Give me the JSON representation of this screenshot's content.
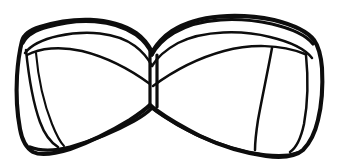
{
  "document": {
    "title": "Bandeau Bra Line Drawing",
    "type": "line-art-illustration",
    "subject": "strapless bandeau bra",
    "description": "Black ink contour drawing of a strapless bandeau bra viewed from the front, flat lay",
    "background_color": "#ffffff",
    "ink_color": "#0d0d0d",
    "width_px": 338,
    "height_px": 168
  },
  "artwork": {
    "style": "hand-drawn black outline, no shading, no fill",
    "line_weights": {
      "outer_contour": "heavy",
      "top_band_inner": "medium",
      "cup_seams": "light",
      "detail_seams": "fine"
    },
    "parts": [
      {
        "name": "left-cup",
        "label": "Left cup"
      },
      {
        "name": "right-cup",
        "label": "Right cup"
      },
      {
        "name": "center-gore",
        "label": "Center gore / bridge"
      },
      {
        "name": "top-band",
        "label": "Top binding band"
      },
      {
        "name": "bottom-band",
        "label": "Bottom underband"
      },
      {
        "name": "left-side-panel",
        "label": "Left side panel"
      },
      {
        "name": "right-side-panel",
        "label": "Right side panel"
      },
      {
        "name": "right-cup-seam",
        "label": "Right cup vertical seam"
      },
      {
        "name": "left-cup-seam",
        "label": "Left cup vertical seam"
      }
    ]
  },
  "geometry": {
    "outer_contour": "M 22 41 C 24 34 30 30 40 27 C 72 17 110 16 136 33 C 143 38 148 44 152 52 C 157 44 163 37 172 31 C 198 14 240 13 274 20 C 294 25 307 31 314 40 C 319 47 321 56 322 68 C 323 86 322 104 318 120 C 315 133 310 143 303 150 C 295 157 282 158 266 156 C 244 153 221 146 200 136 C 182 127 167 118 156 110 C 152 107 151 106 150 105 C 146 109 139 114 130 120 C 112 131 90 142 70 149 C 54 154 41 156 33 152 C 26 148 22 140 20 129 C 17 113 16 94 17 76 C 18 60 20 49 22 41 Z",
    "top_band_line_a": "M 23 43 C 27 35 36 30 48 27 C 78 18 113 19 136 35 C 144 41 149 47 152 55",
    "top_band_line_b": "M 25 53 C 32 44 44 39 58 36 C 86 30 116 32 135 46 C 143 52 148 58 152 66",
    "top_band_line_right_a": "M 152 55 C 157 46 164 39 174 33 C 200 17 240 17 272 24 C 293 29 306 35 313 44",
    "top_band_line_right_b": "M 152 66 C 158 56 167 49 178 43 C 204 30 242 30 270 37 C 291 42 305 49 312 58",
    "bottom_band_line": "M 30 147 C 40 151 54 151 70 147 C 92 141 116 131 134 121 C 143 116 149 111 152 108",
    "bottom_band_line_right": "M 152 108 C 157 112 166 118 178 125 C 199 137 224 147 248 152 C 268 156 286 157 297 153",
    "center_gore_left": "M 150 52 L 150 106",
    "center_gore_right": "M 157 55 L 157 107",
    "left_cup_upper_seam": "M 27 55 C 40 48 60 46 82 51 C 106 57 131 70 150 84",
    "right_cup_upper_seam": "M 153 86 C 172 72 198 58 224 51 C 250 44 280 44 305 54",
    "left_side_panel": "M 26 50 C 28 70 32 100 40 122 C 44 133 50 142 58 147",
    "right_side_panel": "M 306 55 C 308 75 308 102 304 124 C 301 138 296 148 290 152",
    "right_cup_vertical_seam": "M 272 48 C 268 70 262 98 258 120 C 256 133 255 142 255 150",
    "left_cup_inner_seam": "M 36 53 C 38 76 44 104 52 124 C 56 134 60 142 64 146"
  }
}
